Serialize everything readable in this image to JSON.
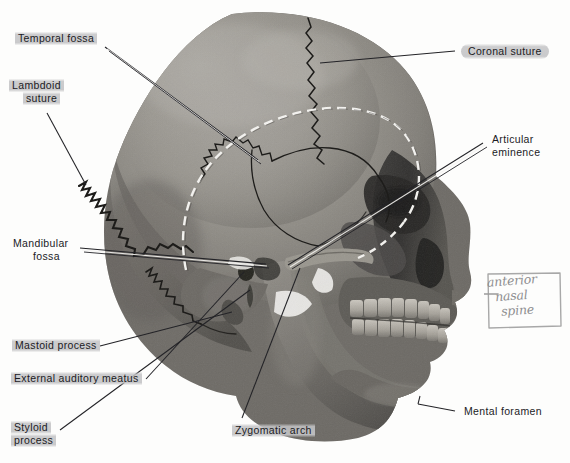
{
  "figure": {
    "background_color": "#fdfdfc",
    "label_highlight_color": "#c4c4c6",
    "label_text_color": "#1b1b1f",
    "leader_line_color": "#232327",
    "handwriting_color": "#8e8e90"
  },
  "labels": {
    "temporal_fossa": {
      "line1": "Temporal fossa"
    },
    "lambdoid_suture": {
      "line1": "Lambdoid",
      "line2": "suture"
    },
    "mandibular_fossa": {
      "line1": "Mandibular",
      "line2": "fossa"
    },
    "mastoid_process": {
      "line1": "Mastoid process"
    },
    "external_auditory_meatus": {
      "line1": "External auditory meatus"
    },
    "styloid_process": {
      "line1": "Styloid",
      "line2": "process"
    },
    "zygomatic_arch": {
      "line1": "Zygomatic arch"
    },
    "coronal_suture": {
      "line1": "Coronal suture"
    },
    "articular_eminence": {
      "line1": "Articular",
      "line2": "eminence"
    },
    "mental_foramen": {
      "line1": "Mental foramen"
    }
  },
  "annotation": {
    "handwritten_note": {
      "word1": "anterior",
      "word2": "nasal",
      "word3": "spine",
      "has_box": true,
      "has_arrow": true,
      "arrow_direction": "left"
    }
  },
  "features": {
    "dashed_outline_name": "temporal-fossa-boundary",
    "suture_lines": [
      "coronal suture",
      "lambdoid suture",
      "squamous suture",
      "parietomastoid suture"
    ]
  }
}
